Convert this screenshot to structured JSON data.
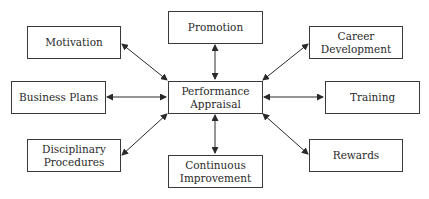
{
  "diagram": {
    "center": {
      "label_line1": "Performance",
      "label_line2": "Appraisal"
    },
    "nodes": {
      "promotion": {
        "label_line1": "Promotion",
        "label_line2": ""
      },
      "motivation": {
        "label_line1": "Motivation",
        "label_line2": ""
      },
      "career_development": {
        "label_line1": "Career",
        "label_line2": "Development"
      },
      "business_plans": {
        "label_line1": "Business Plans",
        "label_line2": ""
      },
      "training": {
        "label_line1": "Training",
        "label_line2": ""
      },
      "disciplinary_procedures": {
        "label_line1": "Disciplinary",
        "label_line2": "Procedures"
      },
      "continuous_improvement": {
        "label_line1": "Continuous",
        "label_line2": "Improvement"
      },
      "rewards": {
        "label_line1": "Rewards",
        "label_line2": ""
      }
    },
    "edges": [
      {
        "from": "Performance Appraisal",
        "to": "Promotion",
        "type": "bidirectional"
      },
      {
        "from": "Performance Appraisal",
        "to": "Motivation",
        "type": "bidirectional"
      },
      {
        "from": "Performance Appraisal",
        "to": "Career Development",
        "type": "bidirectional"
      },
      {
        "from": "Performance Appraisal",
        "to": "Business Plans",
        "type": "bidirectional"
      },
      {
        "from": "Performance Appraisal",
        "to": "Training",
        "type": "bidirectional"
      },
      {
        "from": "Performance Appraisal",
        "to": "Disciplinary Procedures",
        "type": "bidirectional"
      },
      {
        "from": "Performance Appraisal",
        "to": "Continuous Improvement",
        "type": "bidirectional"
      },
      {
        "from": "Performance Appraisal",
        "to": "Rewards",
        "type": "bidirectional"
      }
    ],
    "colors": {
      "stroke": "#3a3a3a",
      "text": "#2a2a2a",
      "background": "#ffffff"
    }
  }
}
